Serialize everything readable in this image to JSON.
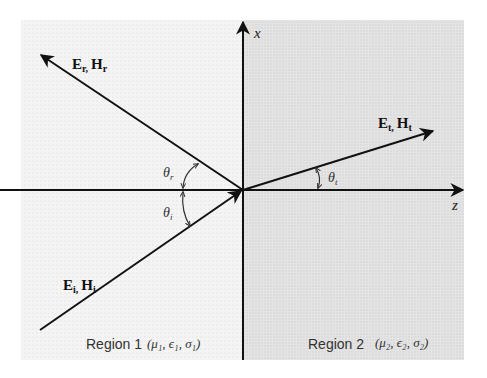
{
  "diagram": {
    "axes": {
      "x_label": "x",
      "z_label": "z"
    },
    "waves": {
      "incident": {
        "label_main_E": "E",
        "sub_E": "i,",
        "label_main_H": "H",
        "sub_H": "i"
      },
      "reflected": {
        "label_main_E": "E",
        "sub_E": "r,",
        "label_main_H": "H",
        "sub_H": "r"
      },
      "transmitted": {
        "label_main_E": "E",
        "sub_E": "t,",
        "label_main_H": "H",
        "sub_H": "t"
      }
    },
    "angles": {
      "theta_r": {
        "symbol": "θ",
        "sub": "r"
      },
      "theta_i": {
        "symbol": "θ",
        "sub": "i"
      },
      "theta_t": {
        "symbol": "θ",
        "sub": "t"
      }
    },
    "regions": [
      {
        "name": "Region 1",
        "params": "(μ₁, ϵ₁, σ₁)",
        "fill": "#f3f3f3"
      },
      {
        "name": "Region 2",
        "params": "(μ₂, ϵ₂, σ₂)",
        "fill": "#e2e2e2"
      }
    ],
    "colors": {
      "line": "#111111",
      "region1": "#f3f3f3",
      "region2": "#e2e2e2"
    }
  }
}
